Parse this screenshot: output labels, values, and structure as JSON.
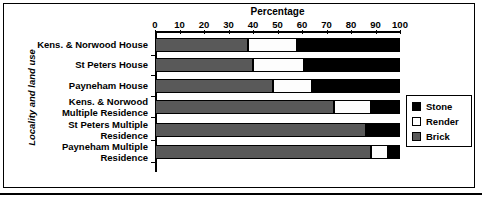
{
  "chart_data": {
    "type": "bar",
    "orientation": "horizontal",
    "stacked": true,
    "stack_total": 100,
    "title": "Percentage",
    "xlabel": "Percentage",
    "ylabel": "Locality and land use",
    "xlim": [
      0,
      100
    ],
    "xticks": [
      0,
      10,
      20,
      30,
      40,
      50,
      60,
      70,
      80,
      90,
      100
    ],
    "xtick_labels": [
      "0",
      "10",
      "20",
      "30",
      "40",
      "50",
      "60",
      "70",
      "80",
      "90",
      "100"
    ],
    "grid": false,
    "legend_position": "right",
    "categories": [
      "Kens. & Norwood House",
      "St Peters House",
      "Payneham House",
      "Kens. & Norwood Multiple Residence",
      "St Peters Multiple Residence",
      "Payneham Multiple Residence"
    ],
    "category_lines": [
      [
        "Kens. & Norwood House"
      ],
      [
        "St Peters House"
      ],
      [
        "Payneham House"
      ],
      [
        "Kens. & Norwood",
        "Multiple Residence"
      ],
      [
        "St Peters Multiple",
        "Residence"
      ],
      [
        "Payneham Multiple",
        "Residence"
      ]
    ],
    "series": [
      {
        "name": "Brick",
        "color": "#595959",
        "values": [
          38,
          40,
          48,
          73,
          86,
          88
        ]
      },
      {
        "name": "Render",
        "color": "#ffffff",
        "values": [
          20,
          21,
          16,
          15,
          0,
          7
        ]
      },
      {
        "name": "Stone",
        "color": "#000000",
        "values": [
          42,
          39,
          36,
          12,
          14,
          5
        ]
      }
    ]
  },
  "legend": {
    "items": [
      {
        "label": "Stone",
        "swatch": "#000000"
      },
      {
        "label": "Render",
        "swatch": "#ffffff"
      },
      {
        "label": "Brick",
        "swatch": "#595959"
      }
    ]
  }
}
